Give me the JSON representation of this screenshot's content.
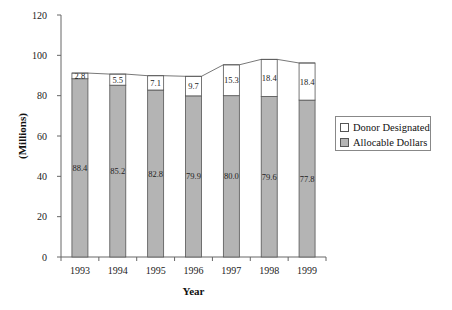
{
  "chart_data": {
    "type": "bar",
    "stacked": true,
    "title": "",
    "xlabel": "Year",
    "ylabel": "(Millions)",
    "ylim": [
      0,
      120
    ],
    "yticks": [
      0,
      20,
      40,
      60,
      80,
      100,
      120
    ],
    "grid": false,
    "legend_position": "right",
    "categories": [
      "1993",
      "1994",
      "1995",
      "1996",
      "1997",
      "1998",
      "1999"
    ],
    "series": [
      {
        "name": "Allocable Dollars",
        "values": [
          88.4,
          85.2,
          82.8,
          79.9,
          80.0,
          79.6,
          77.8
        ],
        "color": "#b4b4b4"
      },
      {
        "name": "Donor Designated",
        "values": [
          2.8,
          5.5,
          7.1,
          9.7,
          15.3,
          18.4,
          18.4
        ],
        "color": "#ffffff"
      }
    ],
    "labels": {
      "allocable": [
        "88.4",
        "85.2",
        "82.8",
        "79.9",
        "80.0",
        "79.6",
        "77.8"
      ],
      "donor": [
        "2.8",
        "5.5",
        "7.1",
        "9.7",
        "15.3",
        "18.4",
        "18.4"
      ]
    },
    "annotations": [
      "series lines connect tops of stacked bars"
    ]
  },
  "legend": {
    "items": [
      {
        "label": "Donor Designated",
        "color": "#ffffff"
      },
      {
        "label": "Allocable Dollars",
        "color": "#b4b4b4"
      }
    ]
  },
  "axes": {
    "x_title": "Year",
    "y_title": "(Millions)",
    "y_tick_labels": [
      "0",
      "20",
      "40",
      "60",
      "80",
      "100",
      "120"
    ],
    "x_tick_labels": [
      "1993",
      "1994",
      "1995",
      "1996",
      "1997",
      "1998",
      "1999"
    ]
  }
}
